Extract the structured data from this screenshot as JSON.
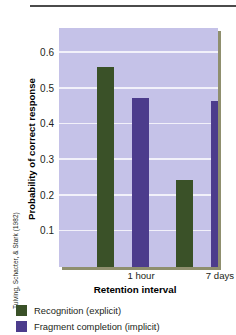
{
  "credit": "Tulving, Schacter, & Stark (1982)",
  "legend": [
    {
      "label": "Recognition (explicit)",
      "color": "#3a5128"
    },
    {
      "label": "Fragment completion (implicit)",
      "color": "#4c3c8c"
    }
  ],
  "chart_data": {
    "type": "bar",
    "title": "",
    "xlabel": "Retention interval",
    "ylabel": "Probability of correct response",
    "categories": [
      "1 hour",
      "7 days"
    ],
    "series": [
      {
        "name": "Recognition (explicit)",
        "color": "#3a5128",
        "values": [
          0.56,
          0.245
        ]
      },
      {
        "name": "Fragment completion (implicit)",
        "color": "#4c3c8c",
        "values": [
          0.475,
          0.465
        ]
      }
    ],
    "ylim": [
      0,
      0.67
    ],
    "yticks": [
      0.6,
      0.5,
      0.4,
      0.3,
      0.2,
      0.1
    ],
    "ytick_labels": [
      "0.6",
      "0.5",
      "0.4",
      "0.3",
      "0.2",
      "0.1"
    ],
    "grid": true,
    "grid_color": "#f2f1fa",
    "plot_background": "#c5c2e8",
    "legend_position": "below"
  }
}
